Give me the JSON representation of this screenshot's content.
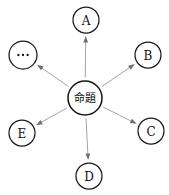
{
  "diagram": {
    "type": "radial-node-graph",
    "canvas": {
      "width": 169,
      "height": 195,
      "background": "#ffffff"
    },
    "center": {
      "id": "center",
      "label": "命題",
      "name": "center-node-proposition",
      "cx": 85,
      "cy": 98,
      "r": 17
    },
    "nodes": [
      {
        "id": "A",
        "label": "A",
        "name": "node-a",
        "cx": 86,
        "cy": 20,
        "r": 13,
        "label_kind": "text"
      },
      {
        "id": "B",
        "label": "B",
        "name": "node-b",
        "cx": 148,
        "cy": 55,
        "r": 13,
        "label_kind": "text"
      },
      {
        "id": "C",
        "label": "C",
        "name": "node-c",
        "cx": 151,
        "cy": 131,
        "r": 13,
        "label_kind": "text"
      },
      {
        "id": "D",
        "label": "D",
        "name": "node-d",
        "cx": 89,
        "cy": 176,
        "r": 13,
        "label_kind": "text"
      },
      {
        "id": "E",
        "label": "E",
        "name": "node-e",
        "cx": 22,
        "cy": 133,
        "r": 13,
        "label_kind": "text"
      },
      {
        "id": "ELL",
        "label": "⋯",
        "name": "node-ellipsis",
        "cx": 23,
        "cy": 55,
        "r": 14,
        "label_kind": "dots"
      }
    ],
    "edges": [
      {
        "from": "center",
        "to": "A",
        "name": "edge-center-to-a",
        "arrow_at": "to",
        "style": "solid"
      },
      {
        "from": "center",
        "to": "B",
        "name": "edge-center-to-b",
        "arrow_at": "to",
        "style": "solid"
      },
      {
        "from": "center",
        "to": "C",
        "name": "edge-center-to-c",
        "arrow_at": "to",
        "style": "solid"
      },
      {
        "from": "center",
        "to": "D",
        "name": "edge-center-to-d",
        "arrow_at": "to",
        "style": "solid"
      },
      {
        "from": "center",
        "to": "E",
        "name": "edge-center-to-e",
        "arrow_at": "to",
        "style": "solid"
      },
      {
        "from": "center",
        "to": "ELL",
        "name": "edge-center-to-ellipsis",
        "arrow_at": "to",
        "style": "solid"
      }
    ],
    "colors": {
      "node_stroke": "#1a1a1a",
      "node_fill": "#ffffff",
      "edge_stroke": "#9a9a9a",
      "arrow_fill": "#6f6f6f",
      "label_color": "#111111"
    }
  }
}
